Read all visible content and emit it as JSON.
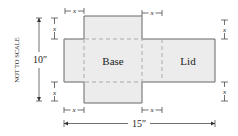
{
  "diagram": {
    "labels": {
      "base": "Base",
      "lid": "Lid",
      "not_to_scale": "NOT TO SCALE",
      "height": "10″",
      "width": "15″",
      "x": "x"
    },
    "colors": {
      "fill": "#ececec",
      "outline": "#666666",
      "fold_line": "#aaaaaa",
      "dimension": "#333333"
    }
  }
}
